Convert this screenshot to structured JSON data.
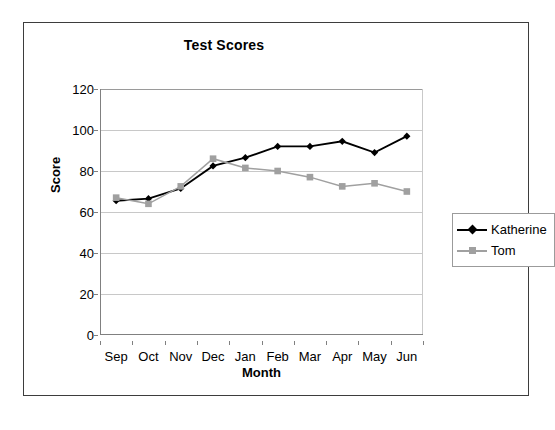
{
  "chart_data": {
    "type": "line",
    "title": "Test Scores",
    "xlabel": "Month",
    "ylabel": "Score",
    "categories": [
      "Sep",
      "Oct",
      "Nov",
      "Dec",
      "Jan",
      "Feb",
      "Mar",
      "Apr",
      "May",
      "Jun"
    ],
    "ylim": [
      0,
      120
    ],
    "yticks": [
      0,
      20,
      40,
      60,
      80,
      100,
      120
    ],
    "grid": true,
    "legend_position": "right",
    "series": [
      {
        "name": "Katherine",
        "color": "#000000",
        "marker": "diamond",
        "values": [
          65.5,
          66.5,
          71.5,
          82.5,
          86.5,
          92,
          92,
          94.5,
          89,
          97
        ]
      },
      {
        "name": "Tom",
        "color": "#a0a0a0",
        "marker": "square",
        "values": [
          67,
          64,
          72.5,
          86,
          81.5,
          80,
          77,
          72.5,
          74,
          70
        ]
      }
    ]
  }
}
